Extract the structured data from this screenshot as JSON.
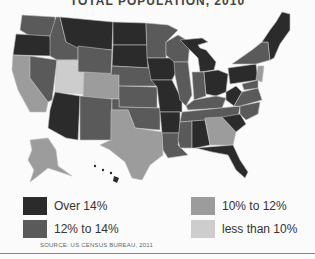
{
  "title": "TOTAL POPULATION, 2010",
  "colors": {
    "over14": "#2b2b2b",
    "12to14": "#5a5a5a",
    "10to12": "#9c9c9c",
    "lt10": "#cdcdcd",
    "border": "#bdbdbd"
  },
  "legend": [
    {
      "label": "Over 14%",
      "color": "#2b2b2b"
    },
    {
      "label": "12% to 14%",
      "color": "#5a5a5a"
    },
    {
      "label": "10% to 12%",
      "color": "#9c9c9c"
    },
    {
      "label": "less than 10%",
      "color": "#cdcdcd"
    }
  ],
  "source": "SOURCE:  US CENSUS BUREAU, 2011"
}
